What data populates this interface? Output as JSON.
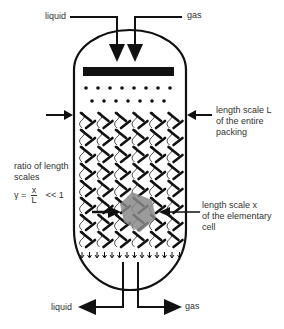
{
  "diagram": {
    "colors": {
      "line": "#111111",
      "text": "#333333",
      "cell_highlight": "#8a8a8a",
      "background": "#ffffff"
    },
    "inlet_labels": {
      "liquid": "liquid",
      "gas": "gas"
    },
    "outlet_labels": {
      "liquid": "liquid",
      "gas": "gas"
    },
    "annotation_L": {
      "line1": "length scale L",
      "line2": "of the entire",
      "line3": "packing"
    },
    "annotation_x": {
      "line1": "length scale x",
      "line2": "of the elementary",
      "line3": "cell"
    },
    "ratio": {
      "line1": "ratio of length",
      "line2": "scales",
      "symbol": "γ =",
      "numerator": "x",
      "denominator": "L",
      "relation": "<< 1"
    },
    "distributor": {
      "dot_rows": [
        8,
        7
      ]
    },
    "packing": {
      "columns": 6,
      "rows": 8
    }
  }
}
